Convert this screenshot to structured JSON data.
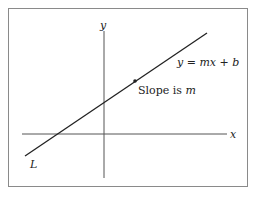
{
  "figure": {
    "axis_x_label": "x",
    "axis_y_label": "y",
    "line_label": "L",
    "equation": "y = mx + b",
    "point_annotation_prefix": "Slope is ",
    "point_annotation_var": "m"
  },
  "colors": {
    "line": "#222222",
    "axes": "#555555",
    "frame": "#8a8a8a"
  }
}
